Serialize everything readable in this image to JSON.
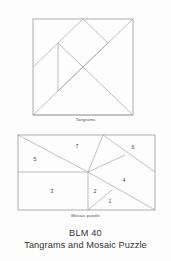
{
  "document": {
    "code": "BLM 40",
    "title": "Tangrams and Mosaic Puzzle",
    "background_color": "#fdfdfd",
    "line_color": "#9a9a9a",
    "text_color": "#3a3a3a"
  },
  "figures": [
    {
      "id": "tangrams",
      "caption": "Tangrams",
      "shape": "square",
      "piece_count": 7,
      "bounds": {
        "x": 33,
        "y": 19,
        "width": 100,
        "height": 96
      }
    },
    {
      "id": "mosaic-puzzle",
      "caption": "Mosaic puzzle",
      "shape": "rectangle",
      "piece_count": 7,
      "bounds": {
        "x": 18,
        "y": 135,
        "width": 137,
        "height": 75
      }
    }
  ],
  "mosaic_regions": [
    {
      "label": "1",
      "x": 110,
      "y": 202
    },
    {
      "label": "2",
      "x": 95,
      "y": 192
    },
    {
      "label": "3",
      "x": 52,
      "y": 192
    },
    {
      "label": "4",
      "x": 124,
      "y": 181
    },
    {
      "label": "5",
      "x": 35,
      "y": 160
    },
    {
      "label": "6",
      "x": 133,
      "y": 148
    },
    {
      "label": "7",
      "x": 77,
      "y": 147
    }
  ]
}
